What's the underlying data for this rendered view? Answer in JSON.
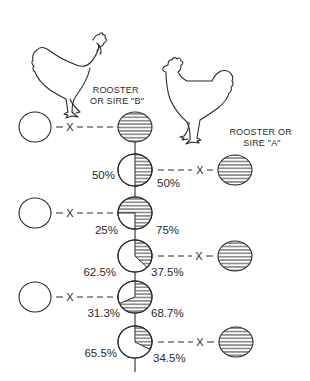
{
  "sires": {
    "b": {
      "label_line1": "ROOSTER",
      "label_line2": "OR SIRE \"B\""
    },
    "a": {
      "label_line1": "ROOSTER OR",
      "label_line2": "SIRE \"A\""
    }
  },
  "cross_symbol": "X",
  "generations": [
    {
      "row": 1,
      "type": "sire_b_purebred",
      "plain_pct": "",
      "hatched_pct": "",
      "plain_value": 0,
      "hatched_value": 100,
      "crossed_with": "dam (plain circle)"
    },
    {
      "row": 2,
      "type": "offspring",
      "plain_pct": "50%",
      "hatched_pct": "50%",
      "plain_value": 50,
      "hatched_value": 50,
      "crossed_with": "sire A"
    },
    {
      "row": 3,
      "type": "offspring",
      "plain_pct": "25%",
      "hatched_pct": "75%",
      "plain_value": 25,
      "hatched_value": 75,
      "crossed_with": "dam (plain circle)"
    },
    {
      "row": 4,
      "type": "offspring",
      "plain_pct": "62.5%",
      "hatched_pct": "37.5%",
      "plain_value": 62.5,
      "hatched_value": 37.5,
      "crossed_with": "sire A"
    },
    {
      "row": 5,
      "type": "offspring",
      "plain_pct": "31.3%",
      "hatched_pct": "68.7%",
      "plain_value": 31.3,
      "hatched_value": 68.7,
      "crossed_with": "dam (plain circle)"
    },
    {
      "row": 6,
      "type": "offspring",
      "plain_pct": "65.5%",
      "hatched_pct": "34.5%",
      "plain_value": 65.5,
      "hatched_value": 34.5,
      "crossed_with": "sire A"
    }
  ],
  "colors": {
    "line": "#2a2a2a",
    "background": "#ffffff"
  }
}
